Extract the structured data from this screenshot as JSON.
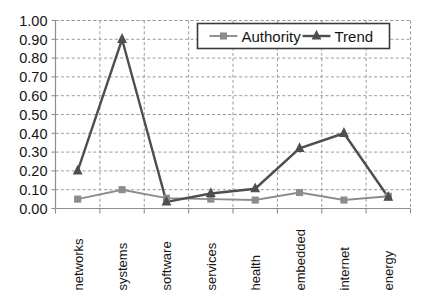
{
  "chart_data": {
    "type": "line",
    "title": "",
    "xlabel": "",
    "ylabel": "",
    "categories": [
      "networks",
      "systems",
      "software",
      "services",
      "health",
      "embedded",
      "internet",
      "energy"
    ],
    "series": [
      {
        "name": "Authority",
        "color": "#8c8c8c",
        "marker": "square",
        "values": [
          0.05,
          0.1,
          0.055,
          0.05,
          0.045,
          0.085,
          0.045,
          0.065
        ]
      },
      {
        "name": "Trend",
        "color": "#4e4e4e",
        "marker": "triangle",
        "values": [
          0.2,
          0.9,
          0.035,
          0.08,
          0.105,
          0.32,
          0.4,
          0.06
        ]
      }
    ],
    "ylim": [
      0.0,
      1.0
    ],
    "ytick_values": [
      0.0,
      0.1,
      0.2,
      0.3,
      0.4,
      0.5,
      0.6,
      0.7,
      0.8,
      0.9,
      1.0
    ],
    "ytick_labels": [
      "0.00",
      "0.10",
      "0.20",
      "0.30",
      "0.40",
      "0.50",
      "0.60",
      "0.70",
      "0.80",
      "0.90",
      "1.00"
    ],
    "grid": {
      "horizontal": true,
      "vertical": true,
      "style": "dashed",
      "color": "#9a9a9a"
    },
    "legend": {
      "position": "top-right-inside",
      "entries": [
        "Authority",
        "Trend"
      ]
    }
  }
}
